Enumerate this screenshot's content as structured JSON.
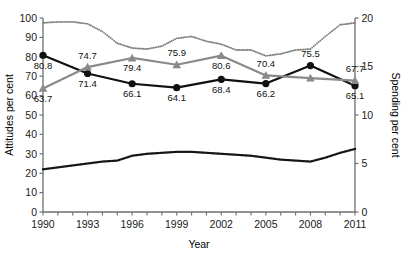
{
  "chart_data": {
    "type": "line",
    "title": "",
    "xlabel": "Year",
    "ylabel": "Attitudes per cent",
    "ylabel_right": "Spending per cent",
    "xlim": [
      1990,
      2011
    ],
    "ylim": [
      0,
      100
    ],
    "ylim_right": [
      0,
      20
    ],
    "grid": false,
    "legend": "none",
    "x_ticks_all": [
      1990,
      1991,
      1992,
      1993,
      1994,
      1995,
      1996,
      1997,
      1998,
      1999,
      2000,
      2001,
      2002,
      2003,
      2004,
      2005,
      2006,
      2007,
      2008,
      2009,
      2010,
      2011
    ],
    "x_tick_labels": [
      "1990",
      "1993",
      "1996",
      "1999",
      "2002",
      "2005",
      "2008",
      "2011"
    ],
    "x_tick_label_values": [
      1990,
      1993,
      1996,
      1999,
      2002,
      2005,
      2008,
      2011
    ],
    "y_tick_labels": [
      "0",
      "10",
      "20",
      "30",
      "40",
      "50",
      "60",
      "70",
      "80",
      "90",
      "100"
    ],
    "y_tick_values": [
      0,
      10,
      20,
      30,
      40,
      50,
      60,
      70,
      80,
      90,
      100
    ],
    "y_right_tick_labels": [
      "0",
      "5",
      "10",
      "15",
      "20"
    ],
    "y_right_tick_values": [
      0,
      5,
      10,
      15,
      20
    ],
    "series": [
      {
        "name": "attitudes-black-circles",
        "axis": "left",
        "marker": "circle",
        "color": "#111111",
        "linewidth": 2.2,
        "style": "solid",
        "x": [
          1990,
          1993,
          1996,
          1999,
          2002,
          2005,
          2008,
          2011
        ],
        "values": [
          80.8,
          71.4,
          66.1,
          64.1,
          68.4,
          66.2,
          75.5,
          65.1
        ],
        "labels": [
          "80.8",
          "71.4",
          "66.1",
          "64.1",
          "68.4",
          "66.2",
          "75.5",
          "65.1"
        ],
        "label_pos": [
          "below",
          "below",
          "below",
          "below",
          "below",
          "below",
          "above",
          "below"
        ]
      },
      {
        "name": "attitudes-grey-triangles",
        "axis": "left",
        "marker": "triangle",
        "color": "#8a8a8a",
        "linewidth": 2.2,
        "style": "solid",
        "x": [
          1990,
          1993,
          1996,
          1999,
          2002,
          2005,
          2008,
          2011
        ],
        "values": [
          63.7,
          74.7,
          79.4,
          75.9,
          80.6,
          70.4,
          69.0,
          67.7
        ],
        "labels": [
          "63.7",
          "74.7",
          "79.4",
          "75.9",
          "80.6",
          "70.4",
          "",
          "67.7"
        ],
        "label_pos": [
          "below",
          "above",
          "below",
          "above",
          "below",
          "above",
          "none",
          "above"
        ]
      },
      {
        "name": "spending-upper-dotted",
        "axis": "right",
        "marker": "small-dot",
        "color": "#7d7d7d",
        "linewidth": 0,
        "style": "dotted",
        "x": [
          1990,
          1991,
          1992,
          1993,
          1994,
          1995,
          1996,
          1997,
          1998,
          1999,
          2000,
          2001,
          2002,
          2003,
          2004,
          2005,
          2006,
          2007,
          2008,
          2009,
          2010,
          2011
        ],
        "values": [
          19.5,
          19.6,
          19.6,
          19.4,
          18.6,
          17.4,
          16.9,
          16.8,
          17.1,
          17.9,
          18.1,
          17.6,
          17.3,
          16.7,
          16.7,
          16.1,
          16.3,
          16.7,
          16.8,
          18.1,
          19.3,
          19.5
        ]
      },
      {
        "name": "spending-lower-dotted",
        "axis": "right",
        "marker": "square-dot",
        "color": "#111111",
        "linewidth": 0,
        "style": "dotted",
        "x": [
          1990,
          1991,
          1992,
          1993,
          1994,
          1995,
          1996,
          1997,
          1998,
          1999,
          2000,
          2001,
          2002,
          2003,
          2004,
          2005,
          2006,
          2007,
          2008,
          2009,
          2010,
          2011
        ],
        "values": [
          4.4,
          4.6,
          4.8,
          5.0,
          5.2,
          5.3,
          5.8,
          6.0,
          6.1,
          6.2,
          6.2,
          6.1,
          6.0,
          5.9,
          5.8,
          5.6,
          5.4,
          5.3,
          5.2,
          5.6,
          6.1,
          6.5
        ]
      }
    ]
  },
  "caption": ""
}
